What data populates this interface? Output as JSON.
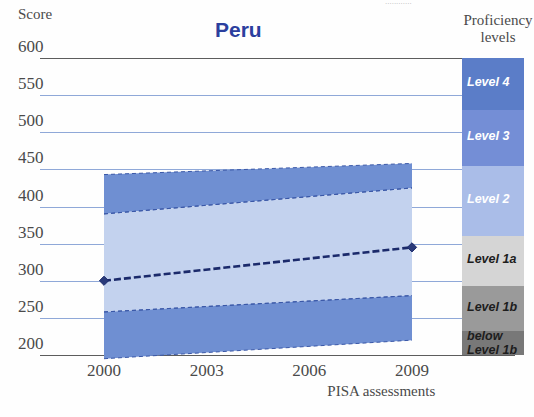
{
  "top_cut_text": "............",
  "title": "Peru",
  "axes": {
    "y_caption": "Score",
    "y_ticks": [
      600,
      550,
      500,
      450,
      400,
      350,
      300,
      250,
      200
    ],
    "x_ticks": [
      "2000",
      "2003",
      "2006",
      "2009"
    ],
    "x_caption": "PISA assessments"
  },
  "legend": {
    "caption_line1": "Proficiency",
    "caption_line2": "levels",
    "items": [
      {
        "label": "Level 4",
        "color": "#5b7dc8",
        "top": 0,
        "height": 52
      },
      {
        "label": "Level 3",
        "color": "#748ed6",
        "top": 52,
        "height": 56
      },
      {
        "label": "Level 2",
        "color": "#aabde8",
        "top": 108,
        "height": 70
      },
      {
        "label": "Level 1a",
        "color": "#d5d5d5",
        "top": 178,
        "height": 50
      },
      {
        "label": "Level 1b",
        "color": "#9a9a9a",
        "top": 228,
        "height": 45
      },
      {
        "label": "below\nLevel 1b",
        "color": "#787878",
        "top": 273,
        "height": 24
      }
    ]
  },
  "colors": {
    "band_dark": "#6f8fd2",
    "band_light": "#c3d2ee",
    "gridline": "#8fa8d8",
    "axis_line": "#5c5c5c",
    "series_line": "#1b2a6b",
    "title": "#2b3f9e"
  },
  "chart_data": {
    "type": "line",
    "title": "Peru",
    "xlabel": "PISA assessments",
    "ylabel": "Score",
    "ylim": [
      180,
      600
    ],
    "grid": true,
    "legend_position": "right",
    "categories": [
      "2000",
      "2003",
      "2006",
      "2009"
    ],
    "series": [
      {
        "name": "Mean score",
        "x": [
          "2000",
          "2009"
        ],
        "values": [
          300,
          345
        ],
        "marker": "diamond",
        "style": "dashed"
      }
    ],
    "confidence_bands": [
      {
        "name": "outer_upper",
        "x": [
          "2000",
          "2009"
        ],
        "y_top": [
          443,
          458
        ],
        "y_bottom": [
          390,
          425
        ]
      },
      {
        "name": "inner",
        "x": [
          "2000",
          "2009"
        ],
        "y_top": [
          390,
          425
        ],
        "y_bottom": [
          258,
          280
        ]
      },
      {
        "name": "outer_lower",
        "x": [
          "2000",
          "2009"
        ],
        "y_top": [
          258,
          280
        ],
        "y_bottom": [
          195,
          220
        ]
      }
    ],
    "annotations": [
      "Distribution band spans 2000 to 2009 PISA assessments"
    ]
  }
}
